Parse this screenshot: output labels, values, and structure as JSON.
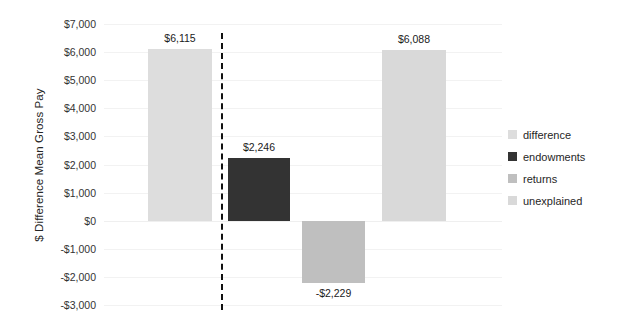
{
  "chart_data": {
    "type": "bar",
    "title": "",
    "xlabel": "",
    "ylabel": "$ Difference Mean Gross Pay",
    "ylim": [
      -3000,
      7000
    ],
    "ytick_step": 1000,
    "grid": true,
    "legend_position": "right",
    "categories": [
      "difference",
      "endowments",
      "returns",
      "unexplained"
    ],
    "values": [
      6115,
      2246,
      -2229,
      6088
    ],
    "data_labels": [
      "$6,115",
      "$2,246",
      "-$2,229",
      "$6,088"
    ],
    "colors": [
      "#DDDDDD",
      "#333333",
      "#BFBFBF",
      "#D9D9D9"
    ],
    "ytick_labels": [
      "$7,000",
      "$6,000",
      "$5,000",
      "$4,000",
      "$3,000",
      "$2,000",
      "$1,000",
      "$0",
      "-$1,000",
      "-$2,000",
      "-$3,000"
    ],
    "ytick_values": [
      7000,
      6000,
      5000,
      4000,
      3000,
      2000,
      1000,
      0,
      -1000,
      -2000,
      -3000
    ],
    "annotations": [
      {
        "type": "vertical-dashed-divider",
        "after_category": "difference"
      }
    ]
  },
  "legend": {
    "items": [
      {
        "label": "difference",
        "color": "#DDDDDD"
      },
      {
        "label": "endowments",
        "color": "#333333"
      },
      {
        "label": "returns",
        "color": "#BFBFBF"
      },
      {
        "label": "unexplained",
        "color": "#D9D9D9"
      }
    ]
  }
}
